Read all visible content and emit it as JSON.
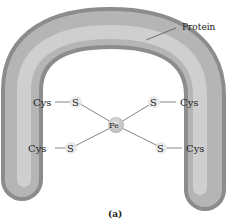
{
  "labels": {
    "protein": "Protein",
    "cys": "Cys",
    "s": "S",
    "fe": "Fe",
    "caption": "(a)"
  },
  "ligands": [
    {
      "cys": "Cys",
      "s": "S",
      "position": "upper-left"
    },
    {
      "cys": "Cys",
      "s": "S",
      "position": "lower-left"
    },
    {
      "cys": "Cys",
      "s": "S",
      "position": "upper-right"
    },
    {
      "cys": "Cys",
      "s": "S",
      "position": "lower-right"
    }
  ],
  "center": "Fe"
}
